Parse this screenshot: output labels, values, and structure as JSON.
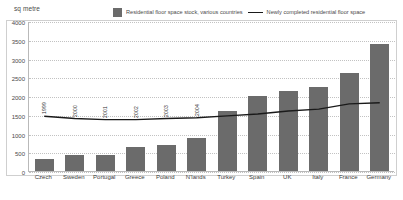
{
  "chart_data": {
    "type": "bar",
    "title": "",
    "unit_caption": "sq metre",
    "xlabel": "",
    "ylabel": "sq metre",
    "ylim": [
      0,
      4000
    ],
    "ytick_labels": [
      "0",
      "500",
      "1000",
      "1500",
      "2000",
      "2500",
      "3000",
      "3500",
      "4000"
    ],
    "ytick_values": [
      0,
      500,
      1000,
      1500,
      2000,
      2500,
      3000,
      3500,
      4000
    ],
    "grid": true,
    "legend_position": "top",
    "categories": [
      "Czech",
      "Sweden",
      "Portugal",
      "Greece",
      "Poland",
      "N'lands",
      "Turkey",
      "Spain",
      "UK",
      "Italy",
      "France",
      "Germany"
    ],
    "point_labels": [
      "1999",
      "2000",
      "2001",
      "2002",
      "2003",
      "2004",
      "2005",
      "2006",
      "2007",
      "2008",
      "2009",
      "2010"
    ],
    "series": [
      {
        "name": "Residential floor space stock, various countries",
        "type": "bar",
        "color": "#6b6b6b",
        "values": [
          330,
          420,
          420,
          630,
          700,
          880,
          1610,
          2000,
          2130,
          2250,
          2620,
          3400
        ]
      },
      {
        "name": "Newly completed residential floor space",
        "type": "line",
        "color": "#1a1a1a",
        "values": [
          1460,
          1400,
          1370,
          1370,
          1400,
          1420,
          1470,
          1520,
          1600,
          1650,
          1790,
          1820
        ]
      }
    ]
  },
  "legend": {
    "bar_label": "Residential floor space stock, various countries",
    "line_label": "Newly completed residential floor space"
  }
}
